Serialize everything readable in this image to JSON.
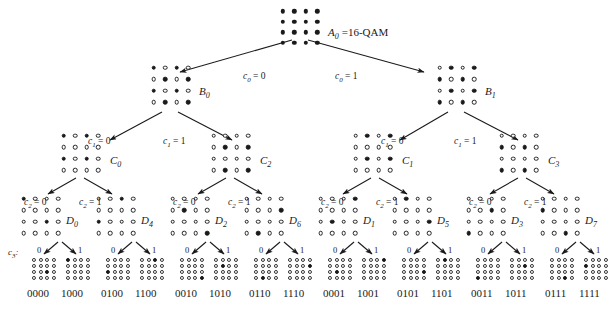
{
  "figure": {
    "root_label_math": "A",
    "root_label_sub": "0",
    "root_label_text": "=16-QAM",
    "c3_tag_math": "c",
    "c3_tag_sub": "3",
    "c3_tag_colon": ":",
    "ink_color": "#1a1a1a",
    "background_color": "#ffffff"
  },
  "edge_labels": {
    "c0_left": {
      "var": "c",
      "sub": "0",
      "eq": " = 0"
    },
    "c0_right": {
      "var": "c",
      "sub": "0",
      "eq": " = 1"
    },
    "c1_zero": {
      "var": "c",
      "sub": "1",
      "eq": " = 0"
    },
    "c1_one": {
      "var": "c",
      "sub": "1",
      "eq": " = 1"
    },
    "c2_zero": {
      "var": "c",
      "sub": "2",
      "eq": " = 0"
    },
    "c2_one": {
      "var": "c",
      "sub": "2",
      "eq": " = 1"
    },
    "c3_zero": "0",
    "c3_one": "1"
  },
  "levels": {
    "A": {
      "name": "level-a",
      "nodes": [
        {
          "id": "A0",
          "label_var": "A",
          "label_sub": "0",
          "label_suffix": "=16-QAM",
          "pattern": "1111111111111111",
          "x": 277,
          "y": 6,
          "label_x": 328,
          "label_y": 27
        }
      ]
    },
    "B": {
      "name": "level-b",
      "nodes": [
        {
          "id": "B0",
          "label_var": "B",
          "label_sub": "0",
          "pattern": "1010010110100101",
          "x": 148,
          "y": 62,
          "label_x": 199,
          "label_y": 86
        },
        {
          "id": "B1",
          "label_var": "B",
          "label_sub": "1",
          "pattern": "0101101001011010",
          "x": 434,
          "y": 62,
          "label_x": 485,
          "label_y": 86
        }
      ]
    },
    "C": {
      "name": "level-c",
      "nodes": [
        {
          "id": "C0",
          "label_var": "C",
          "label_sub": "0",
          "pattern": "1010000010100000",
          "x": 58,
          "y": 130,
          "label_x": 110,
          "label_y": 155
        },
        {
          "id": "C2",
          "label_var": "C",
          "label_sub": "2",
          "pattern": "0000010100000101",
          "x": 208,
          "y": 130,
          "label_x": 260,
          "label_y": 155
        },
        {
          "id": "C1",
          "label_var": "C",
          "label_sub": "1",
          "pattern": "0101000001010000",
          "x": 350,
          "y": 130,
          "label_x": 402,
          "label_y": 155
        },
        {
          "id": "C3",
          "label_var": "C",
          "label_sub": "3",
          "pattern": "0000101000001010",
          "x": 496,
          "y": 130,
          "label_x": 548,
          "label_y": 155
        }
      ]
    },
    "D": {
      "name": "level-d",
      "nodes": [
        {
          "id": "D0",
          "label_var": "D",
          "label_sub": "0",
          "pattern": "1000000000100000",
          "x": 18,
          "y": 193,
          "label_x": 66,
          "label_y": 215
        },
        {
          "id": "D4",
          "label_var": "D",
          "label_sub": "4",
          "pattern": "0010000010000000",
          "x": 93,
          "y": 193,
          "label_x": 141,
          "label_y": 215
        },
        {
          "id": "D2",
          "label_var": "D",
          "label_sub": "2",
          "pattern": "0000010000000001",
          "x": 167,
          "y": 193,
          "label_x": 215,
          "label_y": 215
        },
        {
          "id": "D6",
          "label_var": "D",
          "label_sub": "6",
          "pattern": "0000000100000100",
          "x": 241,
          "y": 193,
          "label_x": 289,
          "label_y": 215
        },
        {
          "id": "D1",
          "label_var": "D",
          "label_sub": "1",
          "pattern": "0001000001000000",
          "x": 315,
          "y": 193,
          "label_x": 363,
          "label_y": 215
        },
        {
          "id": "D5",
          "label_var": "D",
          "label_sub": "5",
          "pattern": "0100000000010000",
          "x": 389,
          "y": 193,
          "label_x": 437,
          "label_y": 215
        },
        {
          "id": "D3",
          "label_var": "D",
          "label_sub": "3",
          "pattern": "0000001000001000",
          "x": 463,
          "y": 193,
          "label_x": 511,
          "label_y": 215
        },
        {
          "id": "D7",
          "label_var": "D",
          "label_sub": "7",
          "pattern": "0000100000000010",
          "x": 537,
          "y": 193,
          "label_x": 585,
          "label_y": 215
        }
      ]
    },
    "E": {
      "name": "level-e-leaves",
      "nodes": [
        {
          "id": "E0000",
          "bits": "0000",
          "pattern": "0000000000100000",
          "x": 31,
          "y": 257,
          "label_x": 27,
          "label_y": 288
        },
        {
          "id": "E1000",
          "bits": "1000",
          "pattern": "1000000000000000",
          "x": 65,
          "y": 257,
          "label_x": 61,
          "label_y": 288
        },
        {
          "id": "E0100",
          "bits": "0100",
          "pattern": "0000000010000000",
          "x": 105,
          "y": 257,
          "label_x": 101,
          "label_y": 288
        },
        {
          "id": "E1100",
          "bits": "1100",
          "pattern": "0010000000000000",
          "x": 139,
          "y": 257,
          "label_x": 135,
          "label_y": 288
        },
        {
          "id": "E0010",
          "bits": "0010",
          "pattern": "0000000000000001",
          "x": 179,
          "y": 257,
          "label_x": 175,
          "label_y": 288
        },
        {
          "id": "E1010",
          "bits": "1010",
          "pattern": "0000010000000000",
          "x": 213,
          "y": 257,
          "label_x": 209,
          "label_y": 288
        },
        {
          "id": "E0110",
          "bits": "0110",
          "pattern": "0000000000000100",
          "x": 253,
          "y": 257,
          "label_x": 249,
          "label_y": 288
        },
        {
          "id": "E1110",
          "bits": "1110",
          "pattern": "0000000100000000",
          "x": 287,
          "y": 257,
          "label_x": 283,
          "label_y": 288
        },
        {
          "id": "E0001",
          "bits": "0001",
          "pattern": "0000000001000000",
          "x": 327,
          "y": 257,
          "label_x": 323,
          "label_y": 288
        },
        {
          "id": "E1001",
          "bits": "1001",
          "pattern": "0001000000000000",
          "x": 361,
          "y": 257,
          "label_x": 357,
          "label_y": 288
        },
        {
          "id": "E0101",
          "bits": "0101",
          "pattern": "0000000000010000",
          "x": 401,
          "y": 257,
          "label_x": 397,
          "label_y": 288
        },
        {
          "id": "E1101",
          "bits": "1101",
          "pattern": "0100000000000000",
          "x": 435,
          "y": 257,
          "label_x": 431,
          "label_y": 288
        },
        {
          "id": "E0011",
          "bits": "0011",
          "pattern": "0000000000001000",
          "x": 475,
          "y": 257,
          "label_x": 471,
          "label_y": 288
        },
        {
          "id": "E1011",
          "bits": "1011",
          "pattern": "0000001000000000",
          "x": 509,
          "y": 257,
          "label_x": 505,
          "label_y": 288
        },
        {
          "id": "E0111",
          "bits": "0111",
          "pattern": "0000000000000010",
          "x": 549,
          "y": 257,
          "label_x": 545,
          "label_y": 288
        },
        {
          "id": "E1111",
          "bits": "1111",
          "pattern": "0000100000000000",
          "x": 583,
          "y": 257,
          "label_x": 579,
          "label_y": 288
        }
      ]
    }
  },
  "edge_label_positions": {
    "c0_left": {
      "x": 243,
      "y": 72
    },
    "c0_right": {
      "x": 335,
      "y": 72
    },
    "c1_a0": {
      "x": 88,
      "y": 137
    },
    "c1_a1": {
      "x": 163,
      "y": 137
    },
    "c1_b0": {
      "x": 381,
      "y": 137
    },
    "c1_b1": {
      "x": 454,
      "y": 137
    },
    "c2_0a": {
      "x": 24,
      "y": 198
    },
    "c2_1a": {
      "x": 79,
      "y": 198
    },
    "c2_0b": {
      "x": 173,
      "y": 198
    },
    "c2_1b": {
      "x": 228,
      "y": 198
    },
    "c2_0c": {
      "x": 321,
      "y": 198
    },
    "c2_1c": {
      "x": 376,
      "y": 198
    },
    "c2_0d": {
      "x": 469,
      "y": 198
    },
    "c2_1d": {
      "x": 524,
      "y": 198
    },
    "c3_tag": {
      "x": 8,
      "y": 248
    }
  },
  "c3_pair_positions": [
    {
      "zero_x": 37,
      "one_x": 78,
      "y": 246
    },
    {
      "zero_x": 111,
      "one_x": 152,
      "y": 246
    },
    {
      "zero_x": 185,
      "one_x": 226,
      "y": 246
    },
    {
      "zero_x": 259,
      "one_x": 300,
      "y": 246
    },
    {
      "zero_x": 333,
      "one_x": 374,
      "y": 246
    },
    {
      "zero_x": 407,
      "one_x": 448,
      "y": 246
    },
    {
      "zero_x": 481,
      "one_x": 522,
      "y": 246
    },
    {
      "zero_x": 555,
      "one_x": 596,
      "y": 246
    }
  ],
  "edges": [
    {
      "name": "a0-to-b0",
      "x1": 292,
      "y1": 40,
      "x2": 180,
      "y2": 72,
      "arrow": true
    },
    {
      "name": "a0-to-b1",
      "x1": 308,
      "y1": 40,
      "x2": 424,
      "y2": 72,
      "arrow": true
    },
    {
      "name": "b0-to-c0",
      "x1": 162,
      "y1": 112,
      "x2": 110,
      "y2": 140,
      "arrow": true
    },
    {
      "name": "b0-to-c2",
      "x1": 178,
      "y1": 112,
      "x2": 232,
      "y2": 140,
      "arrow": true
    },
    {
      "name": "b1-to-c1",
      "x1": 448,
      "y1": 112,
      "x2": 400,
      "y2": 140,
      "arrow": true
    },
    {
      "name": "b1-to-c3",
      "x1": 464,
      "y1": 112,
      "x2": 518,
      "y2": 140,
      "arrow": true
    },
    {
      "name": "c0-to-d0",
      "x1": 76,
      "y1": 178,
      "x2": 48,
      "y2": 194,
      "arrow": true
    },
    {
      "name": "c0-to-d4",
      "x1": 84,
      "y1": 178,
      "x2": 112,
      "y2": 194,
      "arrow": true
    },
    {
      "name": "c2-to-d2",
      "x1": 226,
      "y1": 178,
      "x2": 198,
      "y2": 194,
      "arrow": true
    },
    {
      "name": "c2-to-d6",
      "x1": 234,
      "y1": 178,
      "x2": 262,
      "y2": 194,
      "arrow": true
    },
    {
      "name": "c1-to-d1",
      "x1": 371,
      "y1": 178,
      "x2": 343,
      "y2": 194,
      "arrow": true
    },
    {
      "name": "c1-to-d5",
      "x1": 379,
      "y1": 178,
      "x2": 407,
      "y2": 194,
      "arrow": true
    },
    {
      "name": "c3-to-d3",
      "x1": 518,
      "y1": 178,
      "x2": 490,
      "y2": 194,
      "arrow": true
    },
    {
      "name": "c3-to-d7",
      "x1": 526,
      "y1": 178,
      "x2": 554,
      "y2": 194,
      "arrow": true
    },
    {
      "name": "d0-to-e0",
      "x1": 58,
      "y1": 242,
      "x2": 44,
      "y2": 254,
      "arrow": true
    },
    {
      "name": "d0-to-e1",
      "x1": 62,
      "y1": 242,
      "x2": 76,
      "y2": 254,
      "arrow": true
    },
    {
      "name": "d2-to-e0",
      "x1": 132,
      "y1": 242,
      "x2": 118,
      "y2": 254,
      "arrow": true
    },
    {
      "name": "d2-to-e1",
      "x1": 136,
      "y1": 242,
      "x2": 150,
      "y2": 254,
      "arrow": true
    },
    {
      "name": "d4-to-e0",
      "x1": 206,
      "y1": 242,
      "x2": 192,
      "y2": 254,
      "arrow": true
    },
    {
      "name": "d4-to-e1",
      "x1": 210,
      "y1": 242,
      "x2": 224,
      "y2": 254,
      "arrow": true
    },
    {
      "name": "d6-to-e0",
      "x1": 280,
      "y1": 242,
      "x2": 266,
      "y2": 254,
      "arrow": true
    },
    {
      "name": "d6-to-e1",
      "x1": 284,
      "y1": 242,
      "x2": 298,
      "y2": 254,
      "arrow": true
    },
    {
      "name": "d1-to-e0",
      "x1": 354,
      "y1": 242,
      "x2": 340,
      "y2": 254,
      "arrow": true
    },
    {
      "name": "d1-to-e1",
      "x1": 358,
      "y1": 242,
      "x2": 372,
      "y2": 254,
      "arrow": true
    },
    {
      "name": "d5-to-e0",
      "x1": 428,
      "y1": 242,
      "x2": 414,
      "y2": 254,
      "arrow": true
    },
    {
      "name": "d5-to-e1",
      "x1": 432,
      "y1": 242,
      "x2": 446,
      "y2": 254,
      "arrow": true
    },
    {
      "name": "d3-to-e0",
      "x1": 502,
      "y1": 242,
      "x2": 488,
      "y2": 254,
      "arrow": true
    },
    {
      "name": "d3-to-e1",
      "x1": 506,
      "y1": 242,
      "x2": 520,
      "y2": 254,
      "arrow": true
    },
    {
      "name": "d7-to-e0",
      "x1": 576,
      "y1": 242,
      "x2": 562,
      "y2": 254,
      "arrow": true
    },
    {
      "name": "d7-to-e1",
      "x1": 580,
      "y1": 242,
      "x2": 594,
      "y2": 254,
      "arrow": true
    }
  ]
}
